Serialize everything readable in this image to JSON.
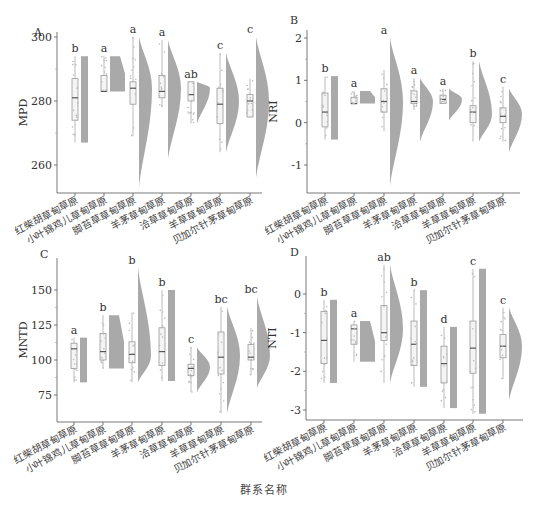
{
  "figure": {
    "x_axis_title": "群系名称",
    "categories": [
      "红柴胡草甸草原",
      "小叶锦鸡儿草甸草原",
      "脚苔草草甸草原",
      "羊茅草甸草原",
      "洽草草甸草原",
      "羊草草甸草原",
      "贝加尔针茅草甸草原"
    ],
    "colors": {
      "violin": "#9a9a9a",
      "box": "#bdbdbd",
      "axis": "#555555",
      "text": "#333333"
    }
  },
  "chart_data": [
    {
      "panel": "A",
      "type": "raincloud (box + half-violin + jitter)",
      "ylabel": "MPD",
      "ylim": [
        250,
        301
      ],
      "yticks": [
        260,
        280,
        300
      ],
      "categories": [
        "红柴胡草甸草原",
        "小叶锦鸡儿草甸草原",
        "脚苔草草甸草原",
        "羊茅草甸草原",
        "洽草草甸草原",
        "羊草草甸草原",
        "贝加尔针茅草甸草原"
      ],
      "letters": [
        "b",
        "a",
        "a",
        "a",
        "ab",
        "c",
        "c"
      ],
      "box": [
        {
          "lo": 267,
          "q1": 274,
          "med": 281,
          "q3": 287,
          "hi": 294
        },
        {
          "lo": 283,
          "q1": 283,
          "med": 283,
          "q3": 288,
          "hi": 294
        },
        {
          "lo": 269,
          "q1": 279,
          "med": 284,
          "q3": 286,
          "hi": 300
        },
        {
          "lo": 278,
          "q1": 281,
          "med": 283,
          "q3": 288,
          "hi": 299
        },
        {
          "lo": 273,
          "q1": 280,
          "med": 282,
          "q3": 286,
          "hi": 286
        },
        {
          "lo": 264,
          "q1": 273,
          "med": 279,
          "q3": 284,
          "hi": 295
        },
        {
          "lo": 275,
          "q1": 275,
          "med": 280,
          "q3": 282,
          "hi": 287
        }
      ],
      "violin": [
        {
          "lo": 267,
          "hi": 294,
          "shape": "flat"
        },
        {
          "lo": 283,
          "hi": 294,
          "shape": "flat"
        },
        {
          "lo": 253,
          "hi": 300,
          "shape": "peak",
          "mode": 284
        },
        {
          "lo": 262,
          "hi": 299,
          "shape": "peak",
          "mode": 284
        },
        {
          "lo": 273,
          "hi": 286,
          "shape": "peak",
          "mode": 284
        },
        {
          "lo": 264,
          "hi": 295,
          "shape": "peak",
          "mode": 280
        },
        {
          "lo": 256,
          "hi": 300,
          "shape": "peak",
          "mode": 280
        }
      ]
    },
    {
      "panel": "B",
      "type": "raincloud (box + half-violin + jitter)",
      "ylabel": "NRI",
      "ylim": [
        -1.6,
        2.2
      ],
      "yticks": [
        -1,
        0,
        1,
        2
      ],
      "categories": [
        "红柴胡草甸草原",
        "小叶锦鸡儿草甸草原",
        "脚苔草草甸草原",
        "羊茅草甸草原",
        "洽草草甸草原",
        "羊草草甸草原",
        "贝加尔针茅草甸草原"
      ],
      "letters": [
        "b",
        "a",
        "a",
        "a",
        "a",
        "b",
        "c"
      ],
      "box": [
        {
          "lo": -0.4,
          "q1": -0.1,
          "med": 0.25,
          "q3": 0.7,
          "hi": 1.1
        },
        {
          "lo": 0.45,
          "q1": 0.45,
          "med": 0.45,
          "q3": 0.6,
          "hi": 0.75
        },
        {
          "lo": -0.2,
          "q1": 0.25,
          "med": 0.5,
          "q3": 0.8,
          "hi": 1.25
        },
        {
          "lo": 0.3,
          "q1": 0.45,
          "med": 0.5,
          "q3": 0.75,
          "hi": 1.05
        },
        {
          "lo": 0.45,
          "q1": 0.45,
          "med": 0.55,
          "q3": 0.65,
          "hi": 0.8
        },
        {
          "lo": -0.45,
          "q1": 0.0,
          "med": 0.25,
          "q3": 0.4,
          "hi": 1.45
        },
        {
          "lo": -0.45,
          "q1": 0.0,
          "med": 0.15,
          "q3": 0.35,
          "hi": 0.85
        }
      ],
      "violin": [
        {
          "lo": -0.4,
          "hi": 1.1,
          "shape": "flat"
        },
        {
          "lo": 0.45,
          "hi": 0.75,
          "shape": "flat"
        },
        {
          "lo": -1.5,
          "hi": 2.0,
          "shape": "peak",
          "mode": 0.5
        },
        {
          "lo": -0.45,
          "hi": 1.05,
          "shape": "peak",
          "mode": 0.5
        },
        {
          "lo": 0.05,
          "hi": 0.8,
          "shape": "peak",
          "mode": 0.55
        },
        {
          "lo": -0.45,
          "hi": 1.45,
          "shape": "peak",
          "mode": 0.2
        },
        {
          "lo": -0.7,
          "hi": 0.8,
          "shape": "peak",
          "mode": 0.2
        }
      ]
    },
    {
      "panel": "C",
      "type": "raincloud (box + half-violin + jitter)",
      "ylabel": "MNTD",
      "ylim": [
        55,
        170
      ],
      "yticks": [
        75,
        100,
        125,
        150
      ],
      "categories": [
        "红柴胡草甸草原",
        "小叶锦鸡儿草甸草原",
        "脚苔草草甸草原",
        "羊茅草甸草原",
        "洽草草甸草原",
        "羊草草甸草原",
        "贝加尔针茅草甸草原"
      ],
      "letters": [
        "a",
        "b",
        "b",
        "b",
        "c",
        "bc",
        "bc"
      ],
      "box": [
        {
          "lo": 84,
          "q1": 94,
          "med": 108,
          "q3": 112,
          "hi": 116
        },
        {
          "lo": 94,
          "q1": 100,
          "med": 106,
          "q3": 119,
          "hi": 132
        },
        {
          "lo": 84,
          "q1": 98,
          "med": 104,
          "q3": 113,
          "hi": 134
        },
        {
          "lo": 85,
          "q1": 96,
          "med": 106,
          "q3": 123,
          "hi": 150
        },
        {
          "lo": 77,
          "q1": 89,
          "med": 94,
          "q3": 97,
          "hi": 109
        },
        {
          "lo": 62,
          "q1": 90,
          "med": 102,
          "q3": 120,
          "hi": 138
        },
        {
          "lo": 89,
          "q1": 100,
          "med": 102,
          "q3": 111,
          "hi": 123
        }
      ],
      "violin": [
        {
          "lo": 84,
          "hi": 116,
          "shape": "flat"
        },
        {
          "lo": 94,
          "hi": 132,
          "shape": "flat"
        },
        {
          "lo": 84,
          "hi": 166,
          "shape": "peak",
          "mode": 103
        },
        {
          "lo": 85,
          "hi": 150,
          "shape": "flat"
        },
        {
          "lo": 77,
          "hi": 109,
          "shape": "peak",
          "mode": 95
        },
        {
          "lo": 62,
          "hi": 138,
          "shape": "peak",
          "mode": 103
        },
        {
          "lo": 80,
          "hi": 145,
          "shape": "peak",
          "mode": 103
        }
      ]
    },
    {
      "panel": "D",
      "type": "raincloud (box + half-violin + jitter)",
      "ylabel": "NTI",
      "ylim": [
        -3.3,
        0.9
      ],
      "yticks": [
        -3,
        -2,
        -1,
        0
      ],
      "categories": [
        "红柴胡草甸草原",
        "小叶锦鸡儿草甸草原",
        "脚苔草草甸草原",
        "羊茅草甸草原",
        "洽草草甸草原",
        "羊草草甸草原",
        "贝加尔针茅草甸草原"
      ],
      "letters": [
        "b",
        "a",
        "ab",
        "b",
        "d",
        "c",
        "c"
      ],
      "box": [
        {
          "lo": -2.3,
          "q1": -1.8,
          "med": -1.2,
          "q3": -0.45,
          "hi": -0.15
        },
        {
          "lo": -1.75,
          "q1": -1.3,
          "med": -0.9,
          "q3": -0.8,
          "hi": -0.7
        },
        {
          "lo": -2.3,
          "q1": -1.2,
          "med": -1.0,
          "q3": -0.3,
          "hi": 0.75
        },
        {
          "lo": -2.4,
          "q1": -1.85,
          "med": -1.3,
          "q3": -0.7,
          "hi": 0.1
        },
        {
          "lo": -2.95,
          "q1": -2.3,
          "med": -1.8,
          "q3": -1.35,
          "hi": -0.85
        },
        {
          "lo": -3.1,
          "q1": -2.05,
          "med": -1.4,
          "q3": -0.7,
          "hi": 0.65
        },
        {
          "lo": -2.2,
          "q1": -1.65,
          "med": -1.35,
          "q3": -1.05,
          "hi": -0.35
        }
      ],
      "violin": [
        {
          "lo": -2.3,
          "hi": -0.15,
          "shape": "flat"
        },
        {
          "lo": -1.75,
          "hi": -0.7,
          "shape": "flat"
        },
        {
          "lo": -2.3,
          "hi": 0.75,
          "shape": "peak",
          "mode": -0.9
        },
        {
          "lo": -2.4,
          "hi": 0.1,
          "shape": "flat"
        },
        {
          "lo": -2.95,
          "hi": -0.85,
          "shape": "flat"
        },
        {
          "lo": -3.1,
          "hi": 0.65,
          "shape": "flat"
        },
        {
          "lo": -2.75,
          "hi": -0.35,
          "shape": "peak",
          "mode": -1.35
        }
      ]
    }
  ]
}
